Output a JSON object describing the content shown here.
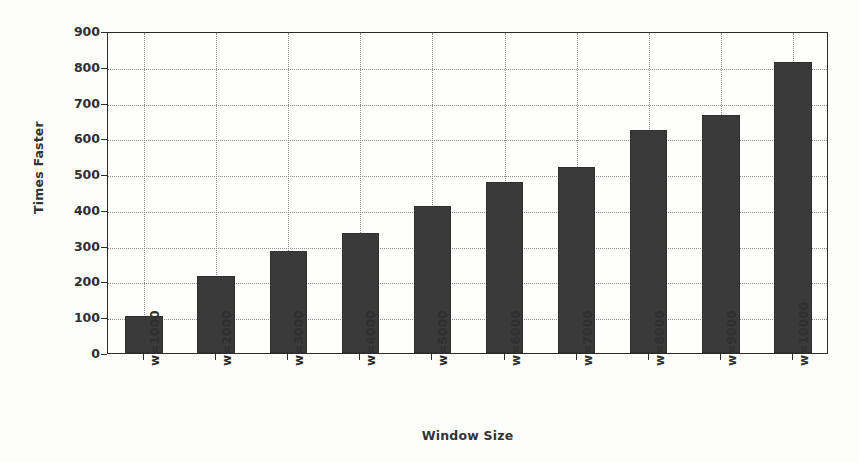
{
  "chart_data": {
    "type": "bar",
    "title": "",
    "xlabel": "Window Size",
    "ylabel": "Times Faster",
    "categories": [
      "w=1000",
      "w=2000",
      "w=3000",
      "w=4000",
      "w=5000",
      "w=6000",
      "w=7000",
      "w=8000",
      "w=9000",
      "w=10000"
    ],
    "values": [
      103,
      214,
      285,
      335,
      412,
      478,
      521,
      622,
      665,
      813
    ],
    "ylim": [
      0,
      900
    ],
    "yticks": [
      0,
      100,
      200,
      300,
      400,
      500,
      600,
      700,
      800,
      900
    ],
    "ytick_labels": [
      "0",
      "100",
      "200",
      "300",
      "400",
      "500",
      "600",
      "700",
      "800",
      "900"
    ],
    "grid": true,
    "grid_style": "dotted",
    "legend": null,
    "bar_color": "#3a3a3a",
    "background_color": "#fdfdfb",
    "axis_color": "#2b2b2b",
    "grid_color": "#8d8d8d"
  }
}
